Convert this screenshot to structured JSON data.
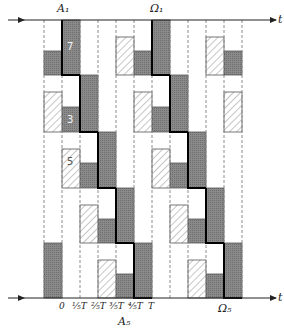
{
  "diagram": {
    "top_axis": {
      "label": "t",
      "markers": [
        {
          "name": "A_1",
          "text": "A₁"
        },
        {
          "name": "Omega_1",
          "text": "Ω₁"
        }
      ]
    },
    "bottom_axis": {
      "label": "t",
      "ticks": [
        "0",
        "⅕T",
        "⅖T",
        "⅗T",
        "⅘T",
        "T"
      ],
      "markers": [
        {
          "name": "A_5",
          "text": "A₅"
        },
        {
          "name": "Omega_5",
          "text": "Ω₅"
        }
      ]
    },
    "block_numbers": [
      {
        "text": "7",
        "col": 1,
        "band": 0,
        "style": "dark"
      },
      {
        "text": "3",
        "col": 1,
        "band": 1,
        "style": "dark"
      },
      {
        "text": "5",
        "col": 1,
        "band": 2,
        "style": "hatched"
      }
    ],
    "grid": {
      "columns": 11,
      "bands": 5,
      "period_columns": 5
    },
    "colors": {
      "dark_block": "#8a8a8a",
      "hatched_block": "#ffffff",
      "hatch_line": "#8c8c8c",
      "staircase": "#000000",
      "dashed": "#8c8c8c"
    }
  }
}
